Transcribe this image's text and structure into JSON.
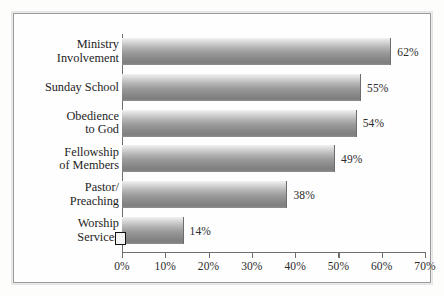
{
  "chart_data": {
    "type": "bar",
    "orientation": "horizontal",
    "title": "",
    "xlabel": "",
    "ylabel": "",
    "categories": [
      "Ministry Involvement",
      "Sunday School",
      "Obedience to God",
      "Fellowship of Members",
      "Pastor/ Preaching",
      "Worship Services"
    ],
    "category_lines": [
      [
        "Ministry",
        "Involvement"
      ],
      [
        "Sunday School"
      ],
      [
        "Obedience",
        "to God"
      ],
      [
        "Fellowship",
        "of Members"
      ],
      [
        "Pastor/",
        "Preaching"
      ],
      [
        "Worship",
        "Services"
      ]
    ],
    "values": [
      62,
      55,
      54,
      49,
      38,
      14
    ],
    "value_labels": [
      "62%",
      "55%",
      "54%",
      "49%",
      "38%",
      "14%"
    ],
    "xlim": [
      0,
      70
    ],
    "xticks": [
      0,
      10,
      20,
      30,
      40,
      50,
      60,
      70
    ],
    "xtick_labels": [
      "0%",
      "10%",
      "20%",
      "30%",
      "40%",
      "50%",
      "60%",
      "70%"
    ],
    "grid": false,
    "legend": false,
    "bar_style": "vertical-gradient-grayscale",
    "colors": {
      "bar_light": "#f2f2f2",
      "bar_dark": "#7e7e7e",
      "axis": "#6f6f6f",
      "frame": "#9a9a9a",
      "text": "#1d1d1d",
      "background": "#fefefe"
    }
  },
  "markers": {
    "origin_square": {
      "name": "origin-square-marker",
      "border_color": "#111111"
    }
  }
}
